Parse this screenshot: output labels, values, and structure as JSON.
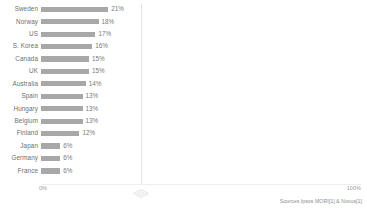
{
  "chart_data": {
    "type": "bar",
    "orientation": "horizontal",
    "title": "",
    "xlabel": "",
    "ylabel": "",
    "xlim": [
      0,
      100
    ],
    "grid": true,
    "gridline_positions": [
      50
    ],
    "legend": "none",
    "axis_ticks": [
      "0%",
      "100%"
    ],
    "categories": [
      "Sweden",
      "Norway",
      "US",
      "S. Korea",
      "Canada",
      "UK",
      "Australia",
      "Spain",
      "Hungary",
      "Belgium",
      "Finland",
      "Japan",
      "Germany",
      "France"
    ],
    "values": [
      21,
      18,
      17,
      16,
      15,
      15,
      14,
      13,
      13,
      13,
      12,
      6,
      6,
      6
    ],
    "value_labels": [
      "21%",
      "18%",
      "17%",
      "16%",
      "15%",
      "15%",
      "14%",
      "13%",
      "13%",
      "13%",
      "12%",
      "6%",
      "6%",
      "6%"
    ],
    "bar_color": "#a8a8a8",
    "annotations": [
      "Sources Ipsos MORI[1] & Novus[1]"
    ]
  },
  "axis": {
    "min_label": "0%",
    "max_label": "100%"
  },
  "source": {
    "text": "Sources Ipsos MORI[1] & Novus[1]"
  },
  "colors": {
    "bar": "#a8a8a8",
    "label": "#6e6e6e",
    "value": "#7a7a7a",
    "axis": "#9a9a9a",
    "grid": "#e3e3e3"
  }
}
